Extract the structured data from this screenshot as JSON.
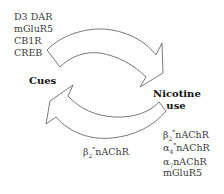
{
  "diagram": {
    "nodes": {
      "cues": {
        "label": "Cues"
      },
      "nicotine_use": {
        "line1": "Nicotine",
        "line2": "use"
      }
    },
    "top_left_list": [
      "D3 DAR",
      "mGluR5",
      "CB1R",
      "CREB"
    ],
    "bottom_middle_label": {
      "greek": "β",
      "sub": "2",
      "sup": "*",
      "rest": "nAChR"
    },
    "bottom_right_list": [
      {
        "greek": "β",
        "sub": "2",
        "sup": "*",
        "rest": "nAChR"
      },
      {
        "greek": "α",
        "sub": "4",
        "sup": "*",
        "rest": "nAChR"
      },
      {
        "greek": "α",
        "sub": "7",
        "sup": "",
        "rest": "nAChR"
      },
      {
        "greek": "",
        "sub": "",
        "sup": "",
        "rest": "mGluR5"
      }
    ],
    "arrows": [
      {
        "name": "cues-to-nicotine-arrow",
        "from": "Cues",
        "to": "Nicotine use"
      },
      {
        "name": "nicotine-to-cues-arrow",
        "from": "Nicotine use",
        "to": "Cues"
      }
    ],
    "colors": {
      "stroke": "#555555",
      "text": "#3a3a3a",
      "bold_text": "#111111",
      "background": "#ffffff"
    }
  }
}
